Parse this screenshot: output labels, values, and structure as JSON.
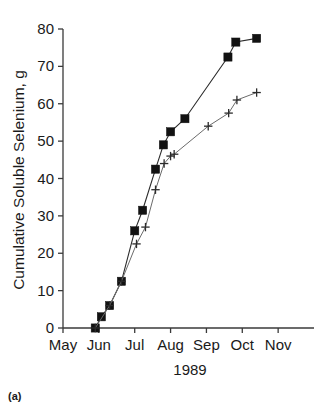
{
  "figure": {
    "caption": "(a)"
  },
  "chart_data": {
    "type": "line",
    "title": "",
    "xlabel": "1989",
    "ylabel": "Cumulative Soluble Selenium, g",
    "xlim": [
      0,
      7
    ],
    "ylim": [
      0,
      80
    ],
    "yticks": [
      0,
      10,
      20,
      30,
      40,
      50,
      60,
      70,
      80
    ],
    "ytick_labels": [
      "0",
      "10",
      "20",
      "30",
      "40",
      "50",
      "60",
      "70",
      "80"
    ],
    "xticks": [
      0,
      1,
      2,
      3,
      4,
      5,
      6
    ],
    "xtick_labels": [
      "May",
      "Jun",
      "Jul",
      "Aug",
      "Sep",
      "Oct",
      "Nov"
    ],
    "grid": false,
    "legend": null,
    "series": [
      {
        "name": "filled-square-series",
        "marker": "filled-square",
        "color": "#121212",
        "x": [
          0.9,
          1.07,
          1.3,
          1.63,
          2.0,
          2.22,
          2.58,
          2.8,
          3.0,
          3.4,
          4.6,
          4.82,
          5.4
        ],
        "y": [
          0.0,
          3.0,
          6.0,
          12.5,
          26.0,
          31.5,
          42.5,
          49.0,
          52.5,
          56.0,
          72.5,
          76.5,
          77.5
        ],
        "x_labels": [
          "May 28",
          "Jun 3",
          "Jun 10",
          "Jun 20",
          "Jul 1",
          "Jul 7",
          "Jul 18",
          "Jul 25",
          "Aug 1",
          "Aug 13",
          "Sep 19",
          "Sep 26",
          "Oct 13"
        ]
      },
      {
        "name": "plus-marker-series",
        "marker": "plus",
        "color": "#2b2b2b",
        "x": [
          0.9,
          1.3,
          1.63,
          2.05,
          2.3,
          2.58,
          2.82,
          3.0,
          3.1,
          4.05,
          4.62,
          4.85,
          5.4
        ],
        "y": [
          0.0,
          6.0,
          12.5,
          22.5,
          27.0,
          37.0,
          44.0,
          46.0,
          46.5,
          54.0,
          57.5,
          61.0,
          63.0
        ],
        "x_labels": [
          "May 28",
          "Jun 10",
          "Jun 20",
          "Jul 2",
          "Jul 9",
          "Jul 18",
          "Jul 25",
          "Aug 1",
          "Aug 4",
          "Sep 2",
          "Sep 20",
          "Sep 27",
          "Oct 13"
        ]
      }
    ]
  }
}
